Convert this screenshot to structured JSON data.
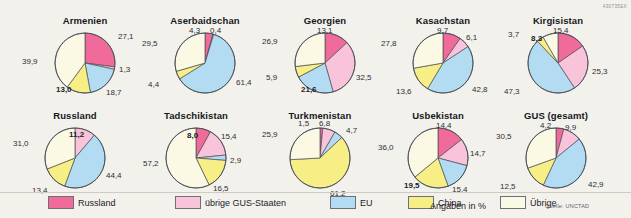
{
  "code": "430735EX",
  "note": "Angaben in %",
  "source": "Quelle: UNCTAD",
  "colors": {
    "russland": "#f06a9a",
    "gus": "#f9c4da",
    "eu": "#b3dcf2",
    "china": "#f7ef86",
    "uebrige": "#fbf8e3",
    "outline": "#4a4f57"
  },
  "legend": [
    {
      "key": "russland",
      "label": "Russland",
      "color": "#f06a9a"
    },
    {
      "key": "gus",
      "label": "übrige GUS-Staaten",
      "color": "#f9c4da"
    },
    {
      "key": "eu",
      "label": "EU",
      "color": "#b3dcf2"
    },
    {
      "key": "china",
      "label": "China",
      "color": "#f7ef86"
    },
    {
      "key": "uebrige",
      "label": "Übrige",
      "color": "#fbf8e3"
    }
  ],
  "chart_data": {
    "type": "pie",
    "unit": "%",
    "categories": [
      "Russland",
      "übrige GUS-Staaten",
      "EU",
      "China",
      "Übrige"
    ],
    "legend_position": "bottom",
    "charts": [
      {
        "title": "Armenien",
        "cx": 85,
        "cy": 63,
        "r": 30,
        "slices": [
          {
            "cat": "Russland",
            "value": 27.1,
            "label": "27,1",
            "lx": 118,
            "ly": 33,
            "inside": false
          },
          {
            "cat": "übrige GUS-Staaten",
            "value": 1.3,
            "label": "1,3",
            "lx": 119,
            "ly": 66,
            "inside": false
          },
          {
            "cat": "EU",
            "value": 18.7,
            "label": "18,7",
            "lx": 106,
            "ly": 89,
            "inside": false
          },
          {
            "cat": "China",
            "value": 13.0,
            "label": "13,0",
            "lx": 56,
            "ly": 86,
            "inside": true
          },
          {
            "cat": "Übrige",
            "value": 39.9,
            "label": "39,9",
            "lx": 22,
            "ly": 58,
            "inside": false
          }
        ]
      },
      {
        "title": "Aserbaidschan",
        "cx": 205,
        "cy": 63,
        "r": 30,
        "slices": [
          {
            "cat": "Russland",
            "value": 4.3,
            "label": "4,3",
            "lx": 189,
            "ly": 27,
            "inside": false
          },
          {
            "cat": "übrige GUS-Staaten",
            "value": 0.4,
            "label": "0,4",
            "lx": 210,
            "ly": 27,
            "inside": false
          },
          {
            "cat": "EU",
            "value": 61.4,
            "label": "61,4",
            "lx": 236,
            "ly": 79,
            "inside": false
          },
          {
            "cat": "China",
            "value": 4.4,
            "label": "4,4",
            "lx": 148,
            "ly": 81,
            "inside": false
          },
          {
            "cat": "Übrige",
            "value": 29.5,
            "label": "29,5",
            "lx": 142,
            "ly": 40,
            "inside": false
          }
        ]
      },
      {
        "title": "Georgien",
        "cx": 325,
        "cy": 63,
        "r": 30,
        "slices": [
          {
            "cat": "Russland",
            "value": 13.1,
            "label": "13,1",
            "lx": 317,
            "ly": 27,
            "inside": false
          },
          {
            "cat": "übrige GUS-Staaten",
            "value": 32.5,
            "label": "32,5",
            "lx": 356,
            "ly": 74,
            "inside": false
          },
          {
            "cat": "EU",
            "value": 21.6,
            "label": "21,6",
            "lx": 301,
            "ly": 86,
            "inside": true
          },
          {
            "cat": "China",
            "value": 5.9,
            "label": "5,9",
            "lx": 266,
            "ly": 74,
            "inside": false
          },
          {
            "cat": "Übrige",
            "value": 26.9,
            "label": "26,9",
            "lx": 262,
            "ly": 38,
            "inside": false
          }
        ]
      },
      {
        "title": "Kasachstan",
        "cx": 443,
        "cy": 63,
        "r": 30,
        "slices": [
          {
            "cat": "Russland",
            "value": 9.7,
            "label": "9,7",
            "lx": 437,
            "ly": 27,
            "inside": false
          },
          {
            "cat": "übrige GUS-Staaten",
            "value": 6.1,
            "label": "6,1",
            "lx": 466,
            "ly": 34,
            "inside": false
          },
          {
            "cat": "EU",
            "value": 42.8,
            "label": "42,8",
            "lx": 472,
            "ly": 86,
            "inside": false
          },
          {
            "cat": "China",
            "value": 13.6,
            "label": "13,6",
            "lx": 396,
            "ly": 88,
            "inside": false
          },
          {
            "cat": "Übrige",
            "value": 27.8,
            "label": "27,8",
            "lx": 381,
            "ly": 40,
            "inside": false
          }
        ]
      },
      {
        "title": "Kirgisistan",
        "cx": 558,
        "cy": 63,
        "r": 30,
        "slices": [
          {
            "cat": "Russland",
            "value": 15.4,
            "label": "15,4",
            "lx": 553,
            "ly": 27,
            "inside": false
          },
          {
            "cat": "übrige GUS-Staaten",
            "value": 25.3,
            "label": "25,3",
            "lx": 592,
            "ly": 68,
            "inside": false
          },
          {
            "cat": "EU",
            "value": 47.3,
            "label": "47,3",
            "lx": 504,
            "ly": 88,
            "inside": false
          },
          {
            "cat": "China",
            "value": 3.7,
            "label": "3,7",
            "lx": 508,
            "ly": 31,
            "inside": false
          },
          {
            "cat": "Übrige",
            "value": 8.3,
            "label": "8,3",
            "lx": 531,
            "ly": 35,
            "inside": true
          }
        ]
      },
      {
        "title": "Russland",
        "cx": 75,
        "cy": 158,
        "r": 30,
        "slices": [
          {
            "cat": "Russland",
            "value": 0,
            "label": "",
            "lx": 0,
            "ly": 0,
            "inside": false
          },
          {
            "cat": "übrige GUS-Staaten",
            "value": 11.2,
            "label": "11,2",
            "lx": 69,
            "ly": 131,
            "inside": true
          },
          {
            "cat": "EU",
            "value": 44.4,
            "label": "44,4",
            "lx": 106,
            "ly": 172,
            "inside": false
          },
          {
            "cat": "China",
            "value": 13.4,
            "label": "13,4",
            "lx": 32,
            "ly": 187,
            "inside": false
          },
          {
            "cat": "Übrige",
            "value": 31.0,
            "label": "31,0",
            "lx": 13,
            "ly": 140,
            "inside": false
          }
        ]
      },
      {
        "title": "Tadschikistan",
        "cx": 196,
        "cy": 158,
        "r": 30,
        "slices": [
          {
            "cat": "Russland",
            "value": 8.0,
            "label": "8,0",
            "lx": 187,
            "ly": 132,
            "inside": true
          },
          {
            "cat": "übrige GUS-Staaten",
            "value": 15.4,
            "label": "15,4",
            "lx": 221,
            "ly": 133,
            "inside": false
          },
          {
            "cat": "EU",
            "value": 2.9,
            "label": "2,9",
            "lx": 230,
            "ly": 157,
            "inside": false
          },
          {
            "cat": "China",
            "value": 16.5,
            "label": "16,5",
            "lx": 213,
            "ly": 185,
            "inside": false
          },
          {
            "cat": "Übrige",
            "value": 57.2,
            "label": "57,2",
            "lx": 143,
            "ly": 160,
            "inside": false
          }
        ]
      },
      {
        "title": "Turkmenistan",
        "cx": 320,
        "cy": 158,
        "r": 30,
        "slices": [
          {
            "cat": "Russland",
            "value": 1.5,
            "label": "1,5",
            "lx": 298,
            "ly": 120,
            "inside": false
          },
          {
            "cat": "übrige GUS-Staaten",
            "value": 6.8,
            "label": "6,8",
            "lx": 319,
            "ly": 120,
            "inside": false
          },
          {
            "cat": "EU",
            "value": 4.7,
            "label": "4,7",
            "lx": 346,
            "ly": 127,
            "inside": false
          },
          {
            "cat": "China",
            "value": 61.2,
            "label": "61,2",
            "lx": 330,
            "ly": 190,
            "inside": false
          },
          {
            "cat": "Übrige",
            "value": 25.9,
            "label": "25,9",
            "lx": 262,
            "ly": 131,
            "inside": false
          }
        ]
      },
      {
        "title": "Usbekistan",
        "cx": 438,
        "cy": 158,
        "r": 30,
        "slices": [
          {
            "cat": "Russland",
            "value": 14.4,
            "label": "14,4",
            "lx": 436,
            "ly": 122,
            "inside": false
          },
          {
            "cat": "übrige GUS-Staaten",
            "value": 14.7,
            "label": "14,7",
            "lx": 470,
            "ly": 150,
            "inside": false
          },
          {
            "cat": "EU",
            "value": 15.4,
            "label": "15,4",
            "lx": 452,
            "ly": 186,
            "inside": false
          },
          {
            "cat": "China",
            "value": 19.5,
            "label": "19,5",
            "lx": 404,
            "ly": 182,
            "inside": true
          },
          {
            "cat": "Übrige",
            "value": 36.0,
            "label": "36,0",
            "lx": 378,
            "ly": 144,
            "inside": false
          }
        ]
      },
      {
        "title": "GUS (gesamt)",
        "cx": 556,
        "cy": 158,
        "r": 30,
        "slices": [
          {
            "cat": "Russland",
            "value": 4.2,
            "label": "4,2",
            "lx": 540,
            "ly": 122,
            "inside": false
          },
          {
            "cat": "übrige GUS-Staaten",
            "value": 9.9,
            "label": "9,9",
            "lx": 565,
            "ly": 124,
            "inside": false
          },
          {
            "cat": "EU",
            "value": 42.9,
            "label": "42,9",
            "lx": 588,
            "ly": 181,
            "inside": false
          },
          {
            "cat": "China",
            "value": 12.5,
            "label": "12,5",
            "lx": 500,
            "ly": 183,
            "inside": false
          },
          {
            "cat": "Übrige",
            "value": 30.5,
            "label": "30,5",
            "lx": 496,
            "ly": 133,
            "inside": false
          }
        ]
      }
    ]
  }
}
